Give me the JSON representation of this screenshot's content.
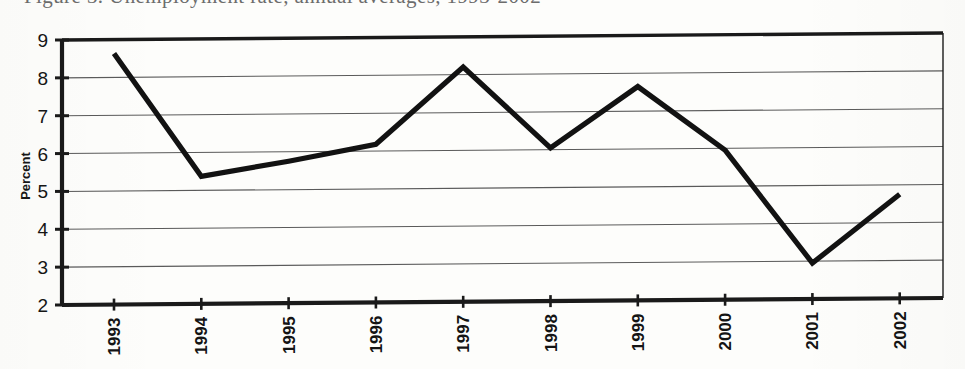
{
  "caption": {
    "text": "Figure 3.  Unemployment rate, annual averages, 1993-2002"
  },
  "chart_data": {
    "type": "line",
    "title": "",
    "xlabel": "",
    "ylabel": "Percent",
    "categories": [
      "1993",
      "1994",
      "1995",
      "1996",
      "1997",
      "1998",
      "1999",
      "2000",
      "2001",
      "2002"
    ],
    "values": [
      8.63,
      5.37,
      5.75,
      6.18,
      8.2,
      6.05,
      7.65,
      5.95,
      2.95,
      4.75
    ],
    "series": [
      {
        "name": "Percent",
        "values": [
          8.63,
          5.37,
          5.75,
          6.18,
          8.2,
          6.05,
          7.65,
          5.95,
          2.95,
          4.75
        ]
      }
    ],
    "ylim": [
      2,
      9
    ],
    "yticks": [
      2,
      3,
      4,
      5,
      6,
      7,
      8,
      9
    ],
    "ytick_labels": [
      "2",
      "3",
      "4",
      "5",
      "6",
      "7",
      "8",
      "9"
    ],
    "grid": true,
    "grid_axis": "y",
    "legend": false,
    "legend_position": "none",
    "line_color": "#121212",
    "grid_color": "#5a5a5a",
    "frame_color": "#1a1a1a",
    "background_color": "#fdfdfb",
    "xtick_rotation": 90
  },
  "axis": {
    "y_label": "Percent"
  }
}
